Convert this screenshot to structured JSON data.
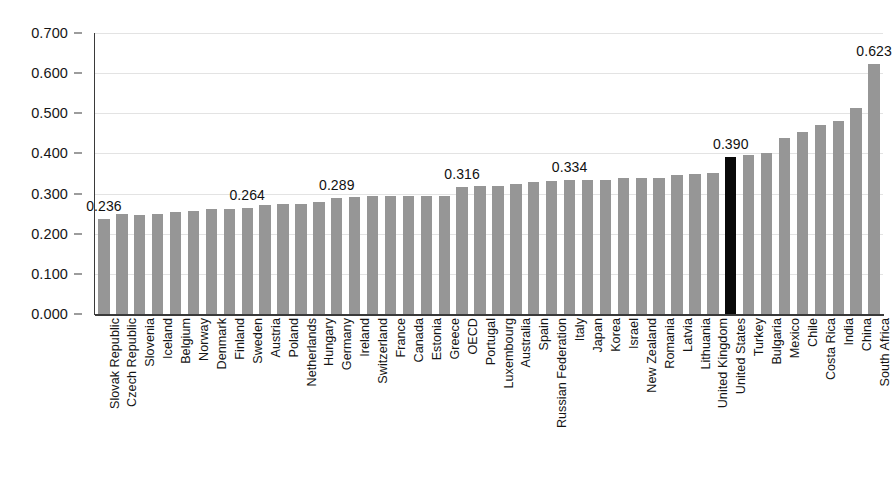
{
  "chart_data": {
    "type": "bar",
    "title": "",
    "subtitle": "",
    "xlabel": "",
    "ylabel": "",
    "ylim": [
      0.0,
      0.7
    ],
    "grid": true,
    "legend": false,
    "y_ticks": [
      "0.000",
      "0.100",
      "0.200",
      "0.300",
      "0.400",
      "0.500",
      "0.600",
      "0.700"
    ],
    "y_tick_values": [
      0.0,
      0.1,
      0.2,
      0.3,
      0.4,
      0.5,
      0.6,
      0.7
    ],
    "bar_color": "#969696",
    "highlight_color": "#090909",
    "highlight_category": "United States",
    "categories": [
      "Slovak Republic",
      "Czech Republic",
      "Slovenia",
      "Iceland",
      "Belgium",
      "Norway",
      "Denmark",
      "Finland",
      "Sweden",
      "Austria",
      "Poland",
      "Netherlands",
      "Hungary",
      "Germany",
      "Ireland",
      "Switzerland",
      "France",
      "Canada",
      "Estonia",
      "Greece",
      "OECD",
      "Portugal",
      "Luxembourg",
      "Australia",
      "Spain",
      "Russian Federation",
      "Italy",
      "Japan",
      "Korea",
      "Israel",
      "New Zealand",
      "Romania",
      "Latvia",
      "Lithuania",
      "United Kingdom",
      "United States",
      "Turkey",
      "Bulgaria",
      "Mexico",
      "Chile",
      "Costa Rica",
      "India",
      "China",
      "South Africa"
    ],
    "values": [
      0.236,
      0.249,
      0.247,
      0.249,
      0.253,
      0.257,
      0.261,
      0.261,
      0.264,
      0.271,
      0.275,
      0.275,
      0.28,
      0.289,
      0.292,
      0.294,
      0.294,
      0.294,
      0.295,
      0.295,
      0.316,
      0.318,
      0.319,
      0.325,
      0.33,
      0.331,
      0.334,
      0.334,
      0.335,
      0.339,
      0.339,
      0.34,
      0.346,
      0.349,
      0.351,
      0.39,
      0.397,
      0.4,
      0.438,
      0.454,
      0.47,
      0.482,
      0.514,
      0.623
    ],
    "labeled_points": [
      {
        "category": "Slovak Republic",
        "label": "0.236",
        "value": 0.236
      },
      {
        "category": "Sweden",
        "label": "0.264",
        "value": 0.264
      },
      {
        "category": "Germany",
        "label": "0.289",
        "value": 0.289
      },
      {
        "category": "OECD",
        "label": "0.316",
        "value": 0.316
      },
      {
        "category": "Italy",
        "label": "0.334",
        "value": 0.334
      },
      {
        "category": "United States",
        "label": "0.390",
        "value": 0.39
      },
      {
        "category": "South Africa",
        "label": "0.623",
        "value": 0.623
      }
    ]
  }
}
